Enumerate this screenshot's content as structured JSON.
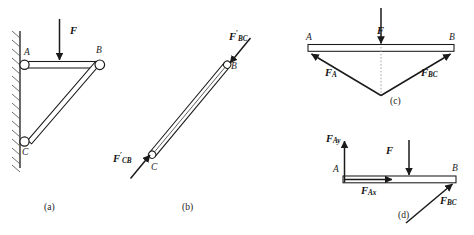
{
  "figure": {
    "type": "engineering-free-body-diagram",
    "panels": [
      {
        "id": "a",
        "caption": "(a)",
        "title": "bracket-assembly",
        "points": [
          "A",
          "B",
          "C"
        ],
        "loads": [
          "F"
        ],
        "members": [
          "AB",
          "CB"
        ],
        "support": "wall"
      },
      {
        "id": "b",
        "caption": "(b)",
        "title": "two-force-member-CB",
        "points": [
          "B",
          "C"
        ],
        "loads": [
          "F'_BC",
          "F'_CB"
        ]
      },
      {
        "id": "c",
        "caption": "(c)",
        "title": "concurrent-force-diagram",
        "points": [
          "A",
          "B"
        ],
        "loads": [
          "F",
          "F_A",
          "F_BC"
        ]
      },
      {
        "id": "d",
        "caption": "(d)",
        "title": "free-body-diagram-AB",
        "points": [
          "A",
          "B"
        ],
        "loads": [
          "F",
          "F_Ay",
          "F_Ax",
          "F_BC"
        ]
      }
    ]
  },
  "labels": {
    "point_a": "A",
    "point_b": "B",
    "point_c": "C",
    "force_f": "F",
    "force_a": "F",
    "force_a_sub": "A",
    "force_bc": "F",
    "force_bc_sub": "BC",
    "force_bc_prime": "F",
    "force_bc_prime_sub": "BC",
    "force_cb_prime": "F",
    "force_cb_prime_sub": "CB",
    "prime_mark": "′",
    "force_ax": "F",
    "force_ax_sub": "Ax",
    "force_ay": "F",
    "force_ay_sub": "Ay",
    "caption_a": "(a)",
    "caption_b": "(b)",
    "caption_c": "(c)",
    "caption_d": "(d)"
  },
  "colors": {
    "stroke": "#1a1a1a",
    "member_fill": "#ffffff",
    "hatch": "#555555",
    "centerline": "#9a9a9a",
    "background": "#ffffff"
  }
}
